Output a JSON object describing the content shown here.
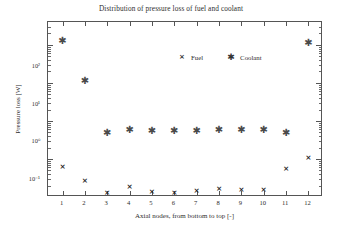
{
  "chart_data": {
    "type": "scatter",
    "title": "Distribution of pressure loss of fuel and coolant",
    "xlabel": "Axial nodes, from bottom to top [-]",
    "ylabel": "Pressure loss [W]",
    "yscale": "log",
    "ylim": [
      0.01,
      400
    ],
    "xlim": [
      0.35,
      12.65
    ],
    "grid": false,
    "legend_position": "top-center-inside",
    "x": [
      1,
      2,
      3,
      4,
      5,
      6,
      7,
      8,
      9,
      10,
      11,
      12
    ],
    "categories": [
      "1",
      "2",
      "3",
      "4",
      "5",
      "6",
      "7",
      "8",
      "9",
      "10",
      "11",
      "12"
    ],
    "ytick_labels": [
      "10²",
      "10¹",
      "10⁰",
      "10⁻¹"
    ],
    "ytick_values": [
      100,
      10,
      1,
      0.1
    ],
    "series": [
      {
        "name": "Fuel",
        "marker": "x",
        "color": "#1f1f1f",
        "values": [
          0.063,
          0.027,
          0.0125,
          0.018,
          0.0135,
          0.0125,
          0.0145,
          0.016,
          0.0155,
          0.0155,
          0.055,
          0.103
        ]
      },
      {
        "name": "Coolant",
        "marker": "asterisk",
        "color": "#4a4a4a",
        "values": [
          130,
          11,
          0.49,
          0.59,
          0.55,
          0.54,
          0.55,
          0.57,
          0.58,
          0.58,
          0.49,
          115
        ]
      }
    ]
  },
  "legend": {
    "entries": [
      {
        "label": "Fuel",
        "glyph": "×",
        "marker_name": "x-marker-icon"
      },
      {
        "label": "Coolant",
        "glyph": "✱",
        "marker_name": "asterisk-marker-icon"
      }
    ]
  },
  "markers": {
    "fuel_glyph": "×",
    "coolant_glyph": "✱"
  }
}
